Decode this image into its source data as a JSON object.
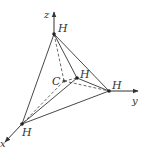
{
  "diagram": {
    "colors": {
      "line": "#333333",
      "dot": "#222222",
      "background": "#ffffff"
    },
    "axes": {
      "z": {
        "label": "z"
      },
      "y": {
        "label": "y"
      },
      "x": {
        "label": "x"
      }
    },
    "atoms": {
      "center": {
        "label": "C"
      },
      "h_top": {
        "label": "H"
      },
      "h_middle": {
        "label": "H"
      },
      "h_right": {
        "label": "H"
      },
      "h_bottom": {
        "label": "H"
      }
    }
  }
}
